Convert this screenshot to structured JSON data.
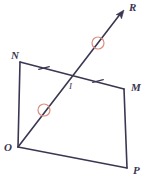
{
  "figure": {
    "width": 148,
    "height": 186,
    "background_color": "#ffffff"
  },
  "style": {
    "line_color": "#3a3752",
    "line_width": 1.6,
    "tick_color": "#3a3752",
    "tick_width": 1.2,
    "congruence_circle_color": "#d98f7d",
    "congruence_circle_width": 1.2,
    "label_color": "#3a3752"
  },
  "points": {
    "N": {
      "label": "N",
      "x": 20,
      "y": 62,
      "label_x": 11,
      "label_y": 59
    },
    "M": {
      "label": "M",
      "x": 124,
      "y": 89,
      "label_x": 131,
      "label_y": 91
    },
    "P": {
      "label": "P",
      "x": 127,
      "y": 168,
      "label_x": 133,
      "label_y": 174
    },
    "O": {
      "label": "O",
      "x": 18,
      "y": 147,
      "label_x": 4,
      "label_y": 151
    },
    "R": {
      "label": "R",
      "x": 124,
      "y": 10,
      "label_x": 129,
      "label_y": 10
    },
    "I": {
      "label": "I",
      "x": 72,
      "y": 77,
      "label_x": 69,
      "label_y": 89
    }
  },
  "segments": [
    {
      "name": "segment-NM",
      "from": "N",
      "to": "M",
      "path": "M20,62 L124,89"
    },
    {
      "name": "segment-MP",
      "from": "M",
      "to": "P",
      "path": "M124,89 L127,168"
    },
    {
      "name": "segment-PO",
      "from": "P",
      "to": "O",
      "path": "M127,168 L18,147"
    },
    {
      "name": "segment-ON",
      "from": "O",
      "to": "N",
      "path": "M18,147 L20,62"
    },
    {
      "name": "ray-OR",
      "from": "O",
      "to": "R",
      "path": "M18,147 L121,13"
    }
  ],
  "arrowheads": [
    {
      "name": "arrowhead-R",
      "tip_x": 124,
      "tip_y": 10,
      "angle_deg": -52.5
    }
  ],
  "tick_marks": [
    {
      "name": "tick-mark-NI",
      "on_segment": "segment-NM",
      "x": 44,
      "y": 68,
      "angle_deg": 75,
      "length": 11
    },
    {
      "name": "tick-mark-IM",
      "on_segment": "segment-NM",
      "x": 98,
      "y": 81,
      "angle_deg": 75,
      "length": 11
    }
  ],
  "congruence_circles": [
    {
      "name": "congruence-mark-OI",
      "x": 44,
      "y": 110,
      "r": 6
    },
    {
      "name": "congruence-mark-IR",
      "x": 98,
      "y": 43,
      "r": 6
    }
  ]
}
